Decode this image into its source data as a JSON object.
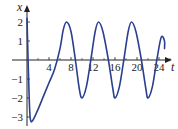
{
  "chart_data": {
    "type": "line",
    "title": "",
    "xlabel": "t",
    "ylabel": "x",
    "xlim": [
      0,
      27
    ],
    "ylim": [
      -3.3,
      2.5
    ],
    "x_ticks": [
      4,
      8,
      12,
      16,
      20,
      24
    ],
    "x_tick_labels": [
      "4",
      "8",
      "12",
      "16",
      "20",
      "24"
    ],
    "y_ticks": [
      2,
      1,
      -1,
      -2,
      -3
    ],
    "y_tick_labels": [
      "2",
      "1",
      "−1",
      "−2",
      "−3"
    ],
    "minor_x_ticks": [
      2,
      6,
      10,
      14,
      18,
      22,
      26
    ],
    "grid": false,
    "legend": null,
    "series": [
      {
        "name": "x(t)",
        "color": "#2b3f8f",
        "points": [
          [
            0,
            2.2
          ],
          [
            0.2,
            0.0
          ],
          [
            0.4,
            -2.0
          ],
          [
            0.6,
            -3.1
          ],
          [
            1.0,
            -3.2
          ],
          [
            2.0,
            -2.6
          ],
          [
            3.0,
            -1.9
          ],
          [
            4.0,
            -1.2
          ],
          [
            5.0,
            -0.5
          ],
          [
            6.0,
            0.6
          ],
          [
            6.6,
            1.6
          ],
          [
            7.2,
            2.0
          ],
          [
            8.0,
            1.5
          ],
          [
            8.8,
            0.0
          ],
          [
            9.5,
            -1.5
          ],
          [
            10.0,
            -2.0
          ],
          [
            10.8,
            -1.4
          ],
          [
            11.6,
            0.0
          ],
          [
            12.4,
            1.5
          ],
          [
            13.0,
            2.0
          ],
          [
            13.8,
            1.5
          ],
          [
            14.8,
            0.0
          ],
          [
            15.6,
            -1.5
          ],
          [
            16.0,
            -2.0
          ],
          [
            16.8,
            -1.4
          ],
          [
            17.6,
            0.0
          ],
          [
            18.4,
            1.5
          ],
          [
            19.0,
            2.0
          ],
          [
            19.8,
            1.5
          ],
          [
            20.8,
            0.0
          ],
          [
            21.6,
            -1.5
          ],
          [
            22.0,
            -2.0
          ],
          [
            22.8,
            -1.4
          ],
          [
            23.6,
            0.0
          ],
          [
            24.4,
            1.2
          ],
          [
            25.0,
            1.0
          ],
          [
            25.0,
            0.6
          ]
        ]
      }
    ]
  }
}
